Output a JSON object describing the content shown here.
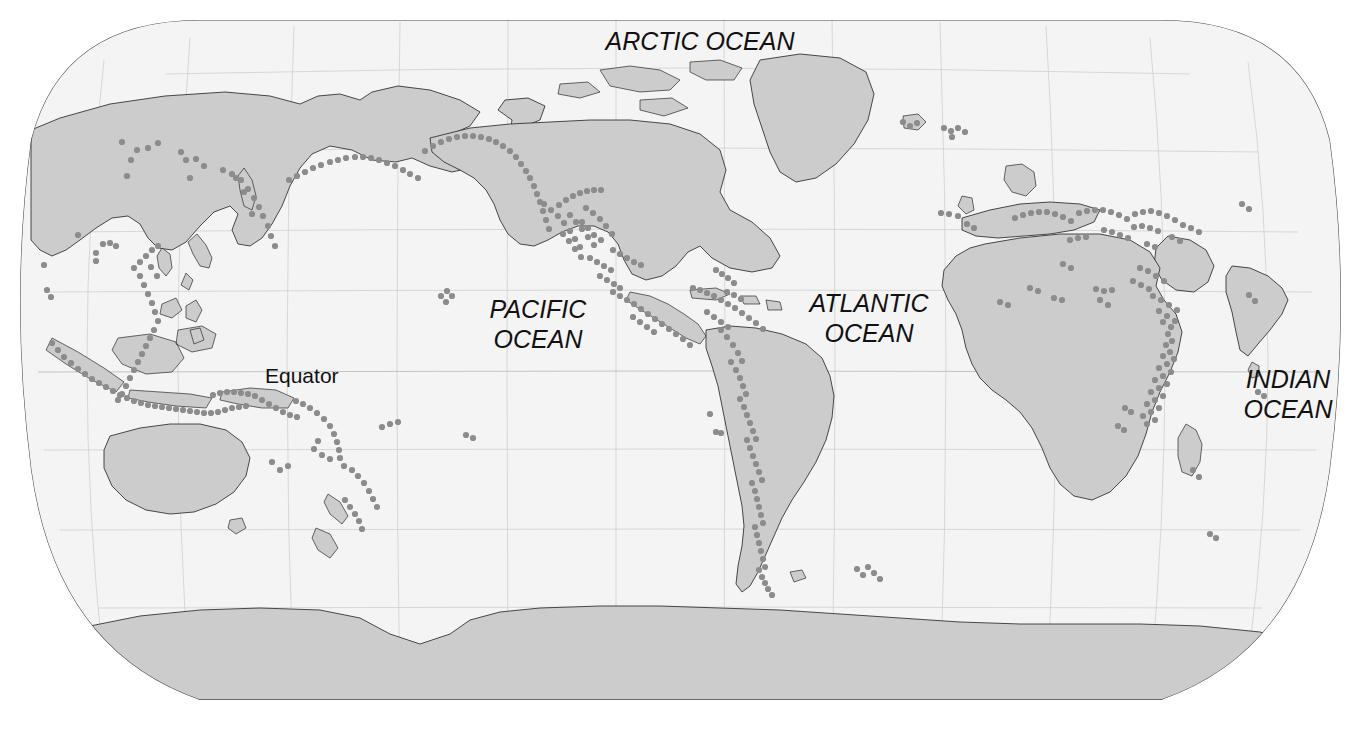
{
  "map": {
    "kind": "world-map",
    "projection": "robinson",
    "title_visible": false,
    "background_color": "#ffffff",
    "ocean_color": "#f4f4f4",
    "land_color": "#cccccc",
    "coastline_color": "#2a2a2a",
    "graticule_color": "#cfcfcf",
    "symbol_color": "#8c8c8c",
    "symbol_meaning": "volcano"
  },
  "labels": {
    "arctic_ocean": "ARCTIC OCEAN",
    "pacific_ocean_line1": "PACIFIC",
    "pacific_ocean_line2": "OCEAN",
    "atlantic_ocean_line1": "ATLANTIC",
    "atlantic_ocean_line2": "OCEAN",
    "indian_ocean_line1": "INDIAN",
    "indian_ocean_line2": "OCEAN",
    "equator": "Equator"
  },
  "graticule": {
    "meridian_spacing_deg": 30,
    "parallel_spacing_deg": 30,
    "equator_shown": true
  },
  "volcano_points": [
    [
      131,
      160
    ],
    [
      137,
      150
    ],
    [
      181,
      152
    ],
    [
      186,
      160
    ],
    [
      196,
      159
    ],
    [
      204,
      166
    ],
    [
      190,
      178
    ],
    [
      122,
      142
    ],
    [
      78,
      235
    ],
    [
      44,
      265
    ],
    [
      47,
      290
    ],
    [
      51,
      297
    ],
    [
      96,
      253
    ],
    [
      103,
      244
    ],
    [
      110,
      243
    ],
    [
      116,
      246
    ],
    [
      96,
      261
    ],
    [
      127,
      176
    ],
    [
      148,
      148
    ],
    [
      158,
      143
    ],
    [
      223,
      170
    ],
    [
      232,
      174
    ],
    [
      241,
      180
    ],
    [
      248,
      189
    ],
    [
      254,
      198
    ],
    [
      259,
      207
    ],
    [
      263,
      216
    ],
    [
      268,
      226
    ],
    [
      271,
      236
    ],
    [
      275,
      246
    ],
    [
      252,
      214
    ],
    [
      244,
      192
    ],
    [
      236,
      178
    ],
    [
      289,
      180
    ],
    [
      297,
      176
    ],
    [
      305,
      172
    ],
    [
      313,
      168
    ],
    [
      321,
      165
    ],
    [
      330,
      162
    ],
    [
      338,
      160
    ],
    [
      346,
      158
    ],
    [
      355,
      157
    ],
    [
      363,
      157
    ],
    [
      371,
      158
    ],
    [
      379,
      160
    ],
    [
      387,
      163
    ],
    [
      395,
      166
    ],
    [
      403,
      170
    ],
    [
      410,
      174
    ],
    [
      418,
      178
    ],
    [
      425,
      151
    ],
    [
      433,
      146
    ],
    [
      441,
      142
    ],
    [
      449,
      139
    ],
    [
      457,
      137
    ],
    [
      465,
      136
    ],
    [
      473,
      136
    ],
    [
      481,
      137
    ],
    [
      489,
      139
    ],
    [
      496,
      142
    ],
    [
      503,
      146
    ],
    [
      510,
      151
    ],
    [
      516,
      157
    ],
    [
      521,
      164
    ],
    [
      526,
      171
    ],
    [
      530,
      178
    ],
    [
      534,
      186
    ],
    [
      537,
      194
    ],
    [
      540,
      202
    ],
    [
      543,
      211
    ],
    [
      546,
      220
    ],
    [
      549,
      229
    ],
    [
      134,
      268
    ],
    [
      140,
      276
    ],
    [
      144,
      285
    ],
    [
      148,
      294
    ],
    [
      152,
      303
    ],
    [
      155,
      312
    ],
    [
      158,
      321
    ],
    [
      140,
      262
    ],
    [
      146,
      256
    ],
    [
      152,
      250
    ],
    [
      158,
      246
    ],
    [
      151,
      267
    ],
    [
      157,
      276
    ],
    [
      154,
      330
    ],
    [
      150,
      338
    ],
    [
      146,
      346
    ],
    [
      142,
      354
    ],
    [
      138,
      362
    ],
    [
      134,
      370
    ],
    [
      130,
      378
    ],
    [
      126,
      386
    ],
    [
      122,
      394
    ],
    [
      118,
      400
    ],
    [
      52,
      343
    ],
    [
      58,
      350
    ],
    [
      64,
      357
    ],
    [
      71,
      363
    ],
    [
      78,
      369
    ],
    [
      85,
      374
    ],
    [
      92,
      379
    ],
    [
      99,
      383
    ],
    [
      106,
      387
    ],
    [
      113,
      391
    ],
    [
      120,
      395
    ],
    [
      127,
      398
    ],
    [
      134,
      401
    ],
    [
      141,
      403
    ],
    [
      148,
      405
    ],
    [
      155,
      406
    ],
    [
      162,
      407
    ],
    [
      169,
      408
    ],
    [
      176,
      409
    ],
    [
      183,
      410
    ],
    [
      190,
      411
    ],
    [
      197,
      412
    ],
    [
      204,
      413
    ],
    [
      211,
      413
    ],
    [
      218,
      412
    ],
    [
      225,
      410
    ],
    [
      232,
      408
    ],
    [
      239,
      407
    ],
    [
      246,
      406
    ],
    [
      213,
      395
    ],
    [
      220,
      393
    ],
    [
      227,
      392
    ],
    [
      234,
      392
    ],
    [
      241,
      393
    ],
    [
      248,
      394
    ],
    [
      255,
      396
    ],
    [
      262,
      400
    ],
    [
      269,
      404
    ],
    [
      276,
      408
    ],
    [
      283,
      412
    ],
    [
      290,
      415
    ],
    [
      297,
      417
    ],
    [
      296,
      401
    ],
    [
      303,
      404
    ],
    [
      310,
      408
    ],
    [
      317,
      413
    ],
    [
      324,
      419
    ],
    [
      330,
      426
    ],
    [
      334,
      434
    ],
    [
      337,
      442
    ],
    [
      339,
      450
    ],
    [
      340,
      458
    ],
    [
      318,
      441
    ],
    [
      314,
      449
    ],
    [
      322,
      455
    ],
    [
      330,
      459
    ],
    [
      344,
      466
    ],
    [
      352,
      470
    ],
    [
      358,
      476
    ],
    [
      364,
      483
    ],
    [
      369,
      491
    ],
    [
      373,
      499
    ],
    [
      377,
      507
    ],
    [
      345,
      500
    ],
    [
      350,
      507
    ],
    [
      355,
      514
    ],
    [
      359,
      521
    ],
    [
      362,
      529
    ],
    [
      280,
      470
    ],
    [
      288,
      466
    ],
    [
      272,
      462
    ],
    [
      382,
      427
    ],
    [
      390,
      424
    ],
    [
      398,
      422
    ],
    [
      441,
      296
    ],
    [
      447,
      291
    ],
    [
      452,
      296
    ],
    [
      446,
      302
    ],
    [
      466,
      435
    ],
    [
      473,
      438
    ],
    [
      544,
      204
    ],
    [
      551,
      210
    ],
    [
      558,
      216
    ],
    [
      564,
      223
    ],
    [
      570,
      231
    ],
    [
      575,
      239
    ],
    [
      580,
      247
    ],
    [
      559,
      205
    ],
    [
      566,
      200
    ],
    [
      573,
      196
    ],
    [
      580,
      193
    ],
    [
      587,
      191
    ],
    [
      594,
      190
    ],
    [
      601,
      190
    ],
    [
      586,
      208
    ],
    [
      593,
      213
    ],
    [
      600,
      219
    ],
    [
      606,
      226
    ],
    [
      612,
      234
    ],
    [
      601,
      240
    ],
    [
      594,
      235
    ],
    [
      588,
      228
    ],
    [
      582,
      222
    ],
    [
      570,
      215
    ],
    [
      576,
      222
    ],
    [
      582,
      229
    ],
    [
      588,
      237
    ],
    [
      594,
      245
    ],
    [
      563,
      234
    ],
    [
      569,
      241
    ],
    [
      575,
      249
    ],
    [
      581,
      257
    ],
    [
      613,
      250
    ],
    [
      620,
      254
    ],
    [
      627,
      258
    ],
    [
      634,
      262
    ],
    [
      641,
      265
    ],
    [
      590,
      258
    ],
    [
      597,
      262
    ],
    [
      604,
      266
    ],
    [
      611,
      270
    ],
    [
      600,
      276
    ],
    [
      607,
      280
    ],
    [
      614,
      284
    ],
    [
      620,
      288
    ],
    [
      613,
      292
    ],
    [
      620,
      296
    ],
    [
      627,
      300
    ],
    [
      634,
      304
    ],
    [
      641,
      309
    ],
    [
      648,
      314
    ],
    [
      655,
      319
    ],
    [
      662,
      324
    ],
    [
      669,
      329
    ],
    [
      676,
      334
    ],
    [
      683,
      339
    ],
    [
      690,
      345
    ],
    [
      633,
      317
    ],
    [
      640,
      322
    ],
    [
      647,
      327
    ],
    [
      654,
      332
    ],
    [
      693,
      288
    ],
    [
      700,
      290
    ],
    [
      707,
      293
    ],
    [
      714,
      296
    ],
    [
      721,
      300
    ],
    [
      728,
      304
    ],
    [
      735,
      308
    ],
    [
      742,
      313
    ],
    [
      749,
      318
    ],
    [
      756,
      323
    ],
    [
      763,
      329
    ],
    [
      707,
      312
    ],
    [
      714,
      317
    ],
    [
      721,
      322
    ],
    [
      728,
      327
    ],
    [
      727,
      292
    ],
    [
      734,
      295
    ],
    [
      741,
      299
    ],
    [
      716,
      270
    ],
    [
      722,
      274
    ],
    [
      728,
      278
    ],
    [
      734,
      283
    ],
    [
      721,
      330
    ],
    [
      727,
      337
    ],
    [
      733,
      345
    ],
    [
      738,
      353
    ],
    [
      742,
      361
    ],
    [
      731,
      362
    ],
    [
      736,
      370
    ],
    [
      740,
      378
    ],
    [
      743,
      386
    ],
    [
      746,
      394
    ],
    [
      740,
      399
    ],
    [
      744,
      407
    ],
    [
      747,
      415
    ],
    [
      750,
      423
    ],
    [
      753,
      431
    ],
    [
      756,
      439
    ],
    [
      747,
      440
    ],
    [
      750,
      448
    ],
    [
      753,
      456
    ],
    [
      756,
      464
    ],
    [
      759,
      472
    ],
    [
      762,
      480
    ],
    [
      752,
      483
    ],
    [
      755,
      491
    ],
    [
      757,
      499
    ],
    [
      759,
      507
    ],
    [
      761,
      515
    ],
    [
      763,
      523
    ],
    [
      755,
      527
    ],
    [
      757,
      535
    ],
    [
      759,
      543
    ],
    [
      761,
      551
    ],
    [
      763,
      559
    ],
    [
      765,
      567
    ],
    [
      759,
      570
    ],
    [
      762,
      577
    ],
    [
      765,
      583
    ],
    [
      768,
      589
    ],
    [
      772,
      595
    ],
    [
      710,
      414
    ],
    [
      716,
      432
    ],
    [
      721,
      433
    ],
    [
      868,
      567
    ],
    [
      874,
      573
    ],
    [
      880,
      579
    ],
    [
      857,
      569
    ],
    [
      863,
      575
    ],
    [
      941,
      213
    ],
    [
      949,
      214
    ],
    [
      958,
      216
    ],
    [
      967,
      224
    ],
    [
      974,
      228
    ],
    [
      1015,
      218
    ],
    [
      1023,
      215
    ],
    [
      1031,
      213
    ],
    [
      1039,
      212
    ],
    [
      1047,
      212
    ],
    [
      1055,
      214
    ],
    [
      1063,
      217
    ],
    [
      1071,
      221
    ],
    [
      1079,
      213
    ],
    [
      1087,
      211
    ],
    [
      1095,
      210
    ],
    [
      1103,
      210
    ],
    [
      1111,
      212
    ],
    [
      1119,
      215
    ],
    [
      1127,
      219
    ],
    [
      1135,
      214
    ],
    [
      1143,
      212
    ],
    [
      1151,
      211
    ],
    [
      1159,
      213
    ],
    [
      1167,
      216
    ],
    [
      1175,
      220
    ],
    [
      1104,
      230
    ],
    [
      1112,
      232
    ],
    [
      1120,
      235
    ],
    [
      1128,
      238
    ],
    [
      1070,
      240
    ],
    [
      1078,
      238
    ],
    [
      1086,
      237
    ],
    [
      1134,
      227
    ],
    [
      1142,
      226
    ],
    [
      1150,
      228
    ],
    [
      1158,
      231
    ],
    [
      1183,
      225
    ],
    [
      1191,
      228
    ],
    [
      1199,
      232
    ],
    [
      1063,
      264
    ],
    [
      1071,
      268
    ],
    [
      1096,
      289
    ],
    [
      1104,
      291
    ],
    [
      1112,
      290
    ],
    [
      1140,
      268
    ],
    [
      1148,
      271
    ],
    [
      1156,
      276
    ],
    [
      1164,
      281
    ],
    [
      1133,
      281
    ],
    [
      1141,
      285
    ],
    [
      1149,
      289
    ],
    [
      1147,
      244
    ],
    [
      1155,
      247
    ],
    [
      1172,
      237
    ],
    [
      1180,
      241
    ],
    [
      1153,
      296
    ],
    [
      1161,
      300
    ],
    [
      1169,
      305
    ],
    [
      1177,
      310
    ],
    [
      1159,
      311
    ],
    [
      1167,
      316
    ],
    [
      1175,
      321
    ],
    [
      1163,
      322
    ],
    [
      1171,
      327
    ],
    [
      1168,
      334
    ],
    [
      1172,
      341
    ],
    [
      1166,
      345
    ],
    [
      1170,
      352
    ],
    [
      1174,
      359
    ],
    [
      1163,
      356
    ],
    [
      1167,
      364
    ],
    [
      1171,
      372
    ],
    [
      1159,
      368
    ],
    [
      1163,
      376
    ],
    [
      1167,
      384
    ],
    [
      1155,
      380
    ],
    [
      1159,
      388
    ],
    [
      1163,
      396
    ],
    [
      1151,
      392
    ],
    [
      1155,
      400
    ],
    [
      1159,
      408
    ],
    [
      1147,
      404
    ],
    [
      1151,
      412
    ],
    [
      1155,
      420
    ],
    [
      1143,
      416
    ],
    [
      1147,
      424
    ],
    [
      1125,
      408
    ],
    [
      1131,
      412
    ],
    [
      1118,
      426
    ],
    [
      1124,
      430
    ],
    [
      1100,
      300
    ],
    [
      1108,
      305
    ],
    [
      1054,
      298
    ],
    [
      1062,
      300
    ],
    [
      1030,
      288
    ],
    [
      1038,
      291
    ],
    [
      1000,
      302
    ],
    [
      1008,
      305
    ],
    [
      1249,
      295
    ],
    [
      1255,
      301
    ],
    [
      1242,
      204
    ],
    [
      1249,
      209
    ],
    [
      1199,
      477
    ],
    [
      1193,
      470
    ],
    [
      1258,
      392
    ],
    [
      1264,
      396
    ],
    [
      1210,
      534
    ],
    [
      1216,
      538
    ],
    [
      944,
      128
    ],
    [
      951,
      131
    ],
    [
      958,
      128
    ],
    [
      965,
      132
    ],
    [
      952,
      137
    ],
    [
      903,
      122
    ],
    [
      910,
      126
    ],
    [
      917,
      123
    ]
  ]
}
